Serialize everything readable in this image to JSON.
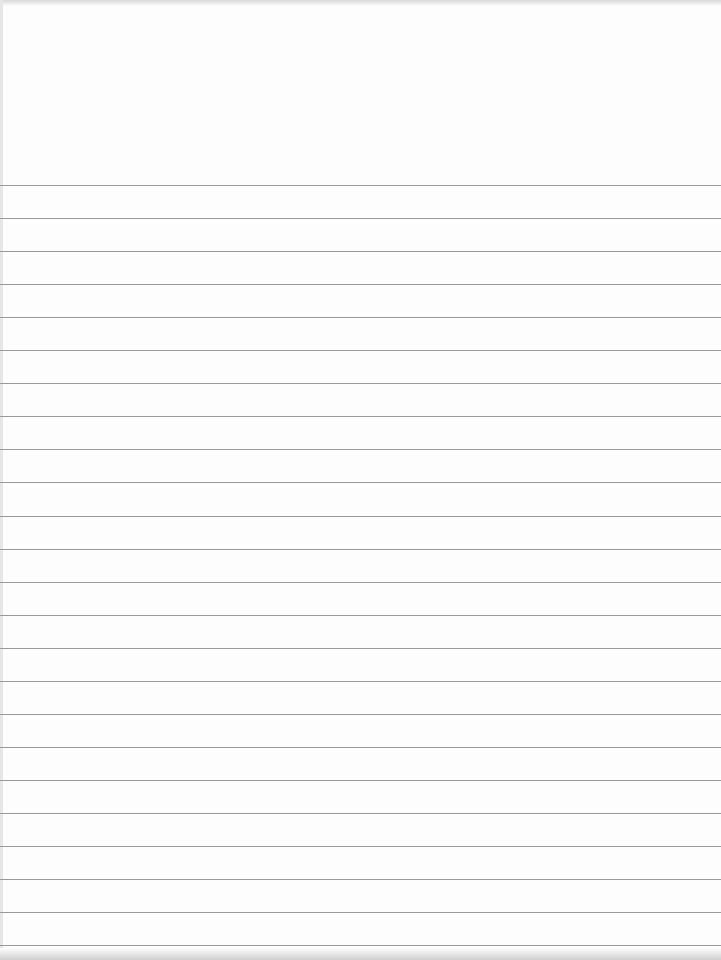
{
  "page": {
    "type": "ruled-paper",
    "header_text": "",
    "rule_color": "#9a9a9a",
    "background": "#fdfdfd",
    "first_rule_y": 185,
    "rule_spacing": 33.05,
    "rule_count": 24
  }
}
